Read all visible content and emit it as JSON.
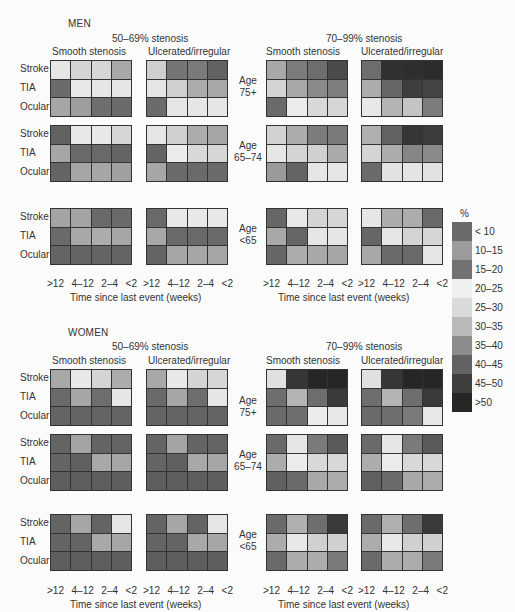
{
  "chart_data": {
    "type": "heatmap",
    "xlabel": "Time since last event (weeks)",
    "x_categories": [
      ">12",
      "4–12",
      "2–4",
      "<2"
    ],
    "row_categories": [
      "Stroke",
      "TIA",
      "Ocular"
    ],
    "legend": {
      "title": "%",
      "bins": [
        {
          "label": "< 10",
          "color": "#6b6b6b"
        },
        {
          "label": "10–15",
          "color": "#9b9b9b"
        },
        {
          "label": "15–20",
          "color": "#727272"
        },
        {
          "label": "20–25",
          "color": "#efefef"
        },
        {
          "label": "25–30",
          "color": "#dadada"
        },
        {
          "label": "30–35",
          "color": "#b9b9b9"
        },
        {
          "label": "35–40",
          "color": "#8c8c8c"
        },
        {
          "label": "40–45",
          "color": "#626262"
        },
        {
          "label": "45–50",
          "color": "#3e3e3e"
        },
        {
          "label": ">50",
          "color": "#262626"
        }
      ]
    },
    "panels": [
      {
        "sex": "MEN",
        "stenosis": "50–69% stenosis",
        "surface": "Smooth stenosis",
        "age": "75+",
        "cells": [
          [
            "#e6e6e6",
            "#d4d4d4",
            "#d6d6d6",
            "#a8a8a8"
          ],
          [
            "#6b6b6b",
            "#e8e8e8",
            "#e6e6e6",
            "#e6e6e6"
          ],
          [
            "#a6a6a6",
            "#9e9e9e",
            "#6e6e6e",
            "#6b6b6b"
          ]
        ]
      },
      {
        "sex": "MEN",
        "stenosis": "50–69% stenosis",
        "surface": "Ulcerated/irregular",
        "age": "75+",
        "cells": [
          [
            "#cfcfcf",
            "#757575",
            "#7a7a7a",
            "#626262"
          ],
          [
            "#e6e6e6",
            "#cfcfcf",
            "#ababab",
            "#a8a8a8"
          ],
          [
            "#6b6b6b",
            "#e6e6e6",
            "#e6e6e6",
            "#e6e6e6"
          ]
        ]
      },
      {
        "sex": "MEN",
        "stenosis": "70–99% stenosis",
        "surface": "Smooth stenosis",
        "age": "75+",
        "cells": [
          [
            "#a8a8a8",
            "#7c7c7c",
            "#6e6e6e",
            "#4a4a4a"
          ],
          [
            "#d4d4d4",
            "#a8a8a8",
            "#8a8a8a",
            "#7e7e7e"
          ],
          [
            "#6b6b6b",
            "#ececec",
            "#d8d8d8",
            "#d6d6d6"
          ]
        ]
      },
      {
        "sex": "MEN",
        "stenosis": "70–99% stenosis",
        "surface": "Ulcerated/irregular",
        "age": "75+",
        "cells": [
          [
            "#6e6e6e",
            "#303030",
            "#2e2e2e",
            "#2c2c2c"
          ],
          [
            "#acacac",
            "#666666",
            "#3e3e3e",
            "#444444"
          ],
          [
            "#e8e8e8",
            "#b4b4b4",
            "#c4c4c4",
            "#7c7c7c"
          ]
        ]
      },
      {
        "sex": "MEN",
        "stenosis": "50–69% stenosis",
        "surface": "Smooth stenosis",
        "age": "65–74",
        "cells": [
          [
            "#626262",
            "#e8e8e8",
            "#e8e8e8",
            "#d6d6d6"
          ],
          [
            "#a6a6a6",
            "#6a6a6a",
            "#6a6a6a",
            "#646464"
          ],
          [
            "#646464",
            "#a6a6a6",
            "#a6a6a6",
            "#a0a0a0"
          ]
        ]
      },
      {
        "sex": "MEN",
        "stenosis": "50–69% stenosis",
        "surface": "Ulcerated/irregular",
        "age": "65–74",
        "cells": [
          [
            "#e6e6e6",
            "#d0d0d0",
            "#acacac",
            "#a6a6a6"
          ],
          [
            "#646464",
            "#ececec",
            "#d8d8d8",
            "#d6d6d6"
          ],
          [
            "#a6a6a6",
            "#6a6a6a",
            "#6a6a6a",
            "#6a6a6a"
          ]
        ]
      },
      {
        "sex": "MEN",
        "stenosis": "70–99% stenosis",
        "surface": "Smooth stenosis",
        "age": "65–74",
        "cells": [
          [
            "#d2d2d2",
            "#acacac",
            "#7c7c7c",
            "#7a7a7a"
          ],
          [
            "#e6e6e6",
            "#d4d4d4",
            "#d0d0d0",
            "#aaaaaa"
          ],
          [
            "#9a9a9a",
            "#646464",
            "#e6e6e6",
            "#e6e6e6"
          ]
        ]
      },
      {
        "sex": "MEN",
        "stenosis": "70–99% stenosis",
        "surface": "Ulcerated/irregular",
        "age": "65–74",
        "cells": [
          [
            "#b0b0b0",
            "#626262",
            "#363636",
            "#3c3c3c"
          ],
          [
            "#d4d4d4",
            "#acacac",
            "#868686",
            "#8a8a8a"
          ],
          [
            "#6a6a6a",
            "#e2e2e2",
            "#e4e4e4",
            "#e2e2e2"
          ]
        ]
      },
      {
        "sex": "MEN",
        "stenosis": "50–69% stenosis",
        "surface": "Smooth stenosis",
        "age": "<65",
        "cells": [
          [
            "#a4a4a4",
            "#a4a4a4",
            "#6a6a6a",
            "#6a6a6a"
          ],
          [
            "#6a6a6a",
            "#a8a8a8",
            "#acacac",
            "#a6a6a6"
          ],
          [
            "#646464",
            "#646464",
            "#646464",
            "#646464"
          ]
        ]
      },
      {
        "sex": "MEN",
        "stenosis": "50–69% stenosis",
        "surface": "Ulcerated/irregular",
        "age": "<65",
        "cells": [
          [
            "#6a6a6a",
            "#e8e8e8",
            "#e8e8e8",
            "#e8e8e8"
          ],
          [
            "#a8a8a8",
            "#6a6a6a",
            "#6a6a6a",
            "#6a6a6a"
          ],
          [
            "#646464",
            "#a6a6a6",
            "#a6a6a6",
            "#a6a6a6"
          ]
        ]
      },
      {
        "sex": "MEN",
        "stenosis": "70–99% stenosis",
        "surface": "Smooth stenosis",
        "age": "<65",
        "cells": [
          [
            "#666666",
            "#e8e8e8",
            "#d4d4d4",
            "#d6d6d6"
          ],
          [
            "#a8a8a8",
            "#666666",
            "#e6e6e6",
            "#e6e6e6"
          ],
          [
            "#666666",
            "#acacac",
            "#a8a8a8",
            "#a6a6a6"
          ]
        ]
      },
      {
        "sex": "MEN",
        "stenosis": "70–99% stenosis",
        "surface": "Ulcerated/irregular",
        "age": "<65",
        "cells": [
          [
            "#e6e6e6",
            "#acacac",
            "#acacac",
            "#6a6a6a"
          ],
          [
            "#666666",
            "#e6e6e6",
            "#d4d4d4",
            "#d6d6d6"
          ],
          [
            "#a8a8a8",
            "#6a6a6a",
            "#6a6a6a",
            "#e6e6e6"
          ]
        ]
      },
      {
        "sex": "WOMEN",
        "stenosis": "50–69% stenosis",
        "surface": "Smooth stenosis",
        "age": "75+",
        "cells": [
          [
            "#a8a8a8",
            "#e8e8e8",
            "#d4d4d4",
            "#acacac"
          ],
          [
            "#6a6a6a",
            "#a6a6a6",
            "#6e6e6e",
            "#e6e6e6"
          ],
          [
            "#646464",
            "#646464",
            "#646464",
            "#646464"
          ]
        ]
      },
      {
        "sex": "WOMEN",
        "stenosis": "50–69% stenosis",
        "surface": "Ulcerated/irregular",
        "age": "75+",
        "cells": [
          [
            "#a8a8a8",
            "#e8e8e8",
            "#d4d4d4",
            "#d6d6d6"
          ],
          [
            "#6a6a6a",
            "#a6a6a6",
            "#6e6e6e",
            "#e6e6e6"
          ],
          [
            "#646464",
            "#646464",
            "#646464",
            "#646464"
          ]
        ]
      },
      {
        "sex": "WOMEN",
        "stenosis": "70–99% stenosis",
        "surface": "Smooth stenosis",
        "age": "75+",
        "cells": [
          [
            "#e0e0e0",
            "#363636",
            "#262626",
            "#262626"
          ],
          [
            "#6e6e6e",
            "#b4b4b4",
            "#6e6e6e",
            "#3a3a3a"
          ],
          [
            "#6a6a6a",
            "#6e6e6e",
            "#ececec",
            "#e8e8e8"
          ]
        ]
      },
      {
        "sex": "WOMEN",
        "stenosis": "70–99% stenosis",
        "surface": "Ulcerated/irregular",
        "age": "75+",
        "cells": [
          [
            "#e0e0e0",
            "#363636",
            "#262626",
            "#262626"
          ],
          [
            "#6e6e6e",
            "#b4b4b4",
            "#6e6e6e",
            "#3a3a3a"
          ],
          [
            "#6a6a6a",
            "#6e6e6e",
            "#7a7a7a",
            "#e8e8e8"
          ]
        ]
      },
      {
        "sex": "WOMEN",
        "stenosis": "50–69% stenosis",
        "surface": "Smooth stenosis",
        "age": "65–74",
        "cells": [
          [
            "#646464",
            "#a4a4a4",
            "#646464",
            "#646464"
          ],
          [
            "#646464",
            "#606060",
            "#a8a8a8",
            "#a6a6a6"
          ],
          [
            "#5e5e5e",
            "#5e5e5e",
            "#5e5e5e",
            "#5e5e5e"
          ]
        ]
      },
      {
        "sex": "WOMEN",
        "stenosis": "50–69% stenosis",
        "surface": "Ulcerated/irregular",
        "age": "65–74",
        "cells": [
          [
            "#646464",
            "#a4a4a4",
            "#646464",
            "#646464"
          ],
          [
            "#646464",
            "#606060",
            "#a8a8a8",
            "#a6a6a6"
          ],
          [
            "#5e5e5e",
            "#5e5e5e",
            "#5e5e5e",
            "#5e5e5e"
          ]
        ]
      },
      {
        "sex": "WOMEN",
        "stenosis": "70–99% stenosis",
        "surface": "Smooth stenosis",
        "age": "65–74",
        "cells": [
          [
            "#6a6a6a",
            "#e6e6e6",
            "#7a7a7a",
            "#5a5a5a"
          ],
          [
            "#acacac",
            "#ececec",
            "#d8d8d8",
            "#d8d8d8"
          ],
          [
            "#606060",
            "#6a6a6a",
            "#a8a8a8",
            "#acacac"
          ]
        ]
      },
      {
        "sex": "WOMEN",
        "stenosis": "70–99% stenosis",
        "surface": "Ulcerated/irregular",
        "age": "65–74",
        "cells": [
          [
            "#6a6a6a",
            "#e6e6e6",
            "#7a7a7a",
            "#5a5a5a"
          ],
          [
            "#acacac",
            "#ececec",
            "#d8d8d8",
            "#d8d8d8"
          ],
          [
            "#606060",
            "#6a6a6a",
            "#a8a8a8",
            "#acacac"
          ]
        ]
      },
      {
        "sex": "WOMEN",
        "stenosis": "50–69% stenosis",
        "surface": "Smooth stenosis",
        "age": "<65",
        "cells": [
          [
            "#646464",
            "#a6a6a6",
            "#646464",
            "#e6e6e6"
          ],
          [
            "#646464",
            "#646464",
            "#a8a8a8",
            "#a6a6a6"
          ],
          [
            "#5e5e5e",
            "#5e5e5e",
            "#5e5e5e",
            "#5e5e5e"
          ]
        ]
      },
      {
        "sex": "WOMEN",
        "stenosis": "50–69% stenosis",
        "surface": "Ulcerated/irregular",
        "age": "<65",
        "cells": [
          [
            "#646464",
            "#a6a6a6",
            "#646464",
            "#e6e6e6"
          ],
          [
            "#646464",
            "#646464",
            "#a8a8a8",
            "#a6a6a6"
          ],
          [
            "#5e5e5e",
            "#5e5e5e",
            "#5e5e5e",
            "#5e5e5e"
          ]
        ]
      },
      {
        "sex": "WOMEN",
        "stenosis": "70–99% stenosis",
        "surface": "Smooth stenosis",
        "age": "<65",
        "cells": [
          [
            "#6a6a6a",
            "#b0b0b0",
            "#6e6e6e",
            "#3a3a3a"
          ],
          [
            "#acacac",
            "#e8e8e8",
            "#d0d0d0",
            "#d0d0d0"
          ],
          [
            "#6a6a6a",
            "#acacac",
            "#acacac",
            "#7a7a7a"
          ]
        ]
      },
      {
        "sex": "WOMEN",
        "stenosis": "70–99% stenosis",
        "surface": "Ulcerated/irregular",
        "age": "<65",
        "cells": [
          [
            "#6a6a6a",
            "#b0b0b0",
            "#6e6e6e",
            "#3a3a3a"
          ],
          [
            "#acacac",
            "#e8e8e8",
            "#d0d0d0",
            "#d0d0d0"
          ],
          [
            "#6a6a6a",
            "#acacac",
            "#acacac",
            "#7a7a7a"
          ]
        ]
      }
    ]
  },
  "labels": {
    "men": "MEN",
    "women": "WOMEN",
    "sten1": "50–69% stenosis",
    "sten2": "70–99% stenosis",
    "smooth": "Smooth stenosis",
    "ulcer": "Ulcerated/irregular",
    "rows": [
      "Stroke",
      "TIA",
      "Ocular"
    ],
    "ages": [
      [
        "Age",
        "75+"
      ],
      [
        "Age",
        "65–74"
      ],
      [
        "Age",
        "<65"
      ]
    ],
    "xticks": [
      ">12",
      "4–12",
      "2–4",
      "<2"
    ],
    "xlabel": "Time since last event (weeks)",
    "legend_title": "%"
  }
}
